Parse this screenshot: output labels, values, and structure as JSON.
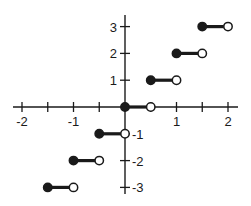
{
  "chart_data": {
    "type": "line",
    "subtype": "step-function",
    "title": "",
    "function": "y = floor(2x)",
    "xlabel": "",
    "ylabel": "",
    "xlim": [
      -2,
      2
    ],
    "ylim": [
      -3,
      3
    ],
    "grid": false,
    "legend": null,
    "x_ticks": [
      -2,
      -1.5,
      -1,
      -0.5,
      0,
      0.5,
      1,
      1.5,
      2
    ],
    "x_tick_labels": [
      {
        "value": -2,
        "label": "-2"
      },
      {
        "value": -1,
        "label": "-1"
      },
      {
        "value": 1,
        "label": "1"
      },
      {
        "value": 2,
        "label": "2"
      }
    ],
    "y_ticks": [
      -3,
      -2,
      -1,
      0,
      1,
      2,
      3
    ],
    "y_tick_labels": [
      {
        "value": 3,
        "label": "3"
      },
      {
        "value": 2,
        "label": "2"
      },
      {
        "value": 1,
        "label": "1"
      },
      {
        "value": -1,
        "label": "-1"
      },
      {
        "value": -2,
        "label": "-2"
      },
      {
        "value": -3,
        "label": "-3"
      }
    ],
    "series": [
      {
        "name": "floor(2x)",
        "segments": [
          {
            "x_start": -1.5,
            "x_end": -1.0,
            "y": -3,
            "start_closed": true,
            "end_closed": false
          },
          {
            "x_start": -1.0,
            "x_end": -0.5,
            "y": -2,
            "start_closed": true,
            "end_closed": false
          },
          {
            "x_start": -0.5,
            "x_end": 0.0,
            "y": -1,
            "start_closed": true,
            "end_closed": false
          },
          {
            "x_start": 0.0,
            "x_end": 0.5,
            "y": 0,
            "start_closed": true,
            "end_closed": false
          },
          {
            "x_start": 0.5,
            "x_end": 1.0,
            "y": 1,
            "start_closed": true,
            "end_closed": false
          },
          {
            "x_start": 1.0,
            "x_end": 1.5,
            "y": 2,
            "start_closed": true,
            "end_closed": false
          },
          {
            "x_start": 1.5,
            "x_end": 2.0,
            "y": 3,
            "start_closed": true,
            "end_closed": false
          }
        ]
      }
    ],
    "annotations": []
  },
  "colors": {
    "ink": "#1a1a1a",
    "background": "#ffffff"
  }
}
